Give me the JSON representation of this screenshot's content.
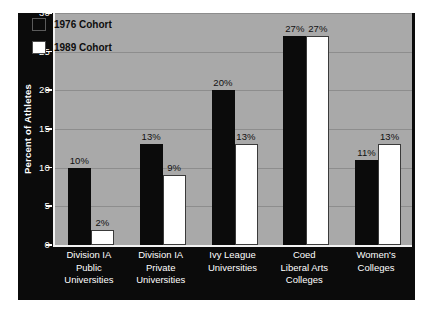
{
  "chart_data": {
    "type": "bar",
    "title": "",
    "xlabel": "",
    "ylabel": "Percent of Athletes",
    "ylim": [
      0,
      30
    ],
    "ytick_values": [
      0,
      5,
      10,
      15,
      20,
      25,
      30
    ],
    "ytick_labels": [
      "0",
      "5",
      "10",
      "15",
      "20",
      "25",
      "30"
    ],
    "grid": true,
    "legend_position": "upper-left",
    "categories": [
      "Division IA Public Universities",
      "Division IA Private Universities",
      "Ivy League Universities",
      "Coed Liberal Arts Colleges",
      "Women's Colleges"
    ],
    "category_lines": [
      [
        "Division IA",
        "Public",
        "Universities"
      ],
      [
        "Division IA",
        "Private",
        "Universities"
      ],
      [
        "Ivy League",
        "Universities"
      ],
      [
        "Coed",
        "Liberal Arts",
        "Colleges"
      ],
      [
        "Women's",
        "Colleges"
      ]
    ],
    "series": [
      {
        "name": "1976 Cohort",
        "color": "#0b0b0b",
        "values": [
          10,
          13,
          20,
          27,
          11
        ],
        "labels": [
          "10%",
          "13%",
          "20%",
          "27%",
          "11%"
        ]
      },
      {
        "name": "1989 Cohort",
        "color": "#ffffff",
        "values": [
          2,
          9,
          13,
          27,
          13
        ],
        "labels": [
          "2%",
          "9%",
          "13%",
          "27%",
          "13%"
        ]
      }
    ]
  },
  "legend": {
    "items": [
      {
        "label": "1976 Cohort",
        "swatch": "black"
      },
      {
        "label": "1989 Cohort",
        "swatch": "white"
      }
    ]
  },
  "axes": {
    "y_title": "Percent of Athletes",
    "y_ticks": [
      "30",
      "25",
      "20",
      "15",
      "10",
      "5",
      "0"
    ]
  },
  "colors": {
    "panel_background": "#0b0b0b",
    "plot_background": "#a9a9a9",
    "gridline": "#8d8d8d",
    "series_1976": "#0b0b0b",
    "series_1989": "#ffffff",
    "axis_text": "#ffffff",
    "bar_label_text": "#111111"
  }
}
